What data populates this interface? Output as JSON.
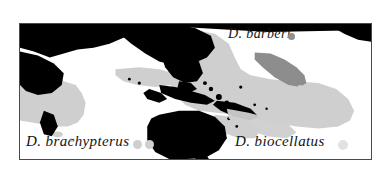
{
  "figure": {
    "type": "distribution-map",
    "width": 392,
    "height": 174,
    "background_color": "#ffffff",
    "frame": {
      "border_color": "#4a4a4a",
      "fill_color": "#ffffff",
      "x": 19,
      "y": 23,
      "width": 353,
      "height": 137
    }
  },
  "map": {
    "region_description": "Indo-Pacific Ocean",
    "land_color": "#000000",
    "ocean_color": "#ffffff",
    "range_light_color": "#cfcfcf",
    "range_medium_color": "#8d8d8d"
  },
  "labels": [
    {
      "id": "barberi",
      "text": "D. barberi",
      "x": 228,
      "y": 26,
      "font_size": 14,
      "dots": [
        {
          "x": 288,
          "y": 33,
          "size": 7,
          "color": "#909090"
        }
      ]
    },
    {
      "id": "brachypterus",
      "text": "D. brachypterus",
      "x": 26,
      "y": 133,
      "font_size": 15,
      "dots": [
        {
          "x": 133,
          "y": 140,
          "size": 9,
          "color": "#cfcfcf"
        },
        {
          "x": 145,
          "y": 140,
          "size": 9,
          "color": "#cfcfcf"
        }
      ]
    },
    {
      "id": "biocellatus",
      "text": "D. biocellatus",
      "x": 235,
      "y": 133,
      "font_size": 15,
      "dots": [
        {
          "x": 338,
          "y": 140,
          "size": 10,
          "color": "#e2e2e2"
        }
      ]
    }
  ],
  "colors": {
    "land": "#000000",
    "ocean": "#ffffff",
    "range_light": "#cfcfcf",
    "range_medium": "#8d8d8d",
    "frame_border": "#4a4a4a",
    "text": "#141414"
  }
}
